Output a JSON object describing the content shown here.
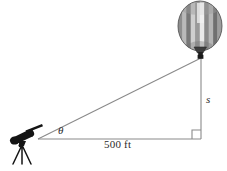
{
  "figure": {
    "background_color": "#ffffff",
    "width": 227,
    "height": 171
  },
  "labels": {
    "base_distance": "500 ft",
    "height": "s",
    "angle": "θ"
  },
  "objects": {
    "balloon": {
      "name": "hot-air-balloon",
      "envelope_colors": [
        "#8c8c8c",
        "#bdbdbd",
        "#d8d8d8",
        "#6e6e6e",
        "#a6a6a6",
        "#efefef"
      ],
      "outline_color": "#555555",
      "basket_color": "#2a2a2a"
    },
    "telescope": {
      "name": "telescope-on-tripod",
      "color": "#111111"
    }
  },
  "geometry": {
    "line_color": "#8a8a8a",
    "right_angle_marker": true,
    "vertices": {
      "observer": [
        38,
        139
      ],
      "base_corner": [
        201,
        139
      ],
      "balloon_point": [
        201,
        58
      ]
    }
  }
}
